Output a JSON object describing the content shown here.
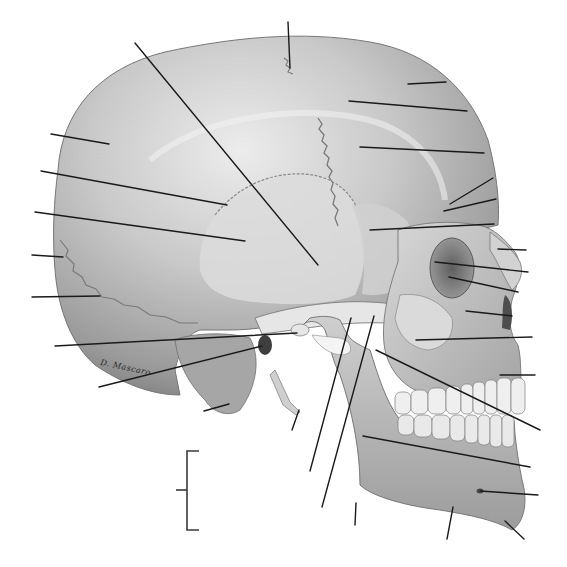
{
  "diagram": {
    "title": "",
    "view": "lateral-skull",
    "signature": "D. Mascaro",
    "colors": {
      "background": "#ffffff",
      "bone_light": "#e4e4e4",
      "bone_mid": "#bdbdbd",
      "bone_dark": "#8a8a8a",
      "bone_shadow": "#6a6a6a",
      "suture": "#7a7a7a",
      "leader_line": "#1a1a1a"
    },
    "leader_lines": [
      {
        "id": "L1",
        "x1": 288,
        "y1": 22,
        "x2": 290,
        "y2": 68
      },
      {
        "id": "L2",
        "x1": 135,
        "y1": 43,
        "x2": 318,
        "y2": 265
      },
      {
        "id": "L3",
        "x1": 408,
        "y1": 84,
        "x2": 446,
        "y2": 82
      },
      {
        "id": "L4",
        "x1": 349,
        "y1": 101,
        "x2": 467,
        "y2": 111
      },
      {
        "id": "L5",
        "x1": 360,
        "y1": 147,
        "x2": 484,
        "y2": 153
      },
      {
        "id": "L6",
        "x1": 51,
        "y1": 134,
        "x2": 109,
        "y2": 144
      },
      {
        "id": "L7",
        "x1": 41,
        "y1": 171,
        "x2": 227,
        "y2": 205
      },
      {
        "id": "L8",
        "x1": 35,
        "y1": 212,
        "x2": 245,
        "y2": 241
      },
      {
        "id": "L9",
        "x1": 450,
        "y1": 204,
        "x2": 493,
        "y2": 178
      },
      {
        "id": "L10",
        "x1": 444,
        "y1": 211,
        "x2": 496,
        "y2": 199
      },
      {
        "id": "L11",
        "x1": 370,
        "y1": 230,
        "x2": 494,
        "y2": 224
      },
      {
        "id": "L12",
        "x1": 32,
        "y1": 255,
        "x2": 63,
        "y2": 257
      },
      {
        "id": "L13",
        "x1": 498,
        "y1": 249,
        "x2": 526,
        "y2": 250
      },
      {
        "id": "L14",
        "x1": 435,
        "y1": 262,
        "x2": 528,
        "y2": 272
      },
      {
        "id": "L15",
        "x1": 449,
        "y1": 277,
        "x2": 518,
        "y2": 292
      },
      {
        "id": "L16",
        "x1": 32,
        "y1": 297,
        "x2": 100,
        "y2": 296
      },
      {
        "id": "L17",
        "x1": 466,
        "y1": 311,
        "x2": 512,
        "y2": 316
      },
      {
        "id": "L18",
        "x1": 416,
        "y1": 340,
        "x2": 532,
        "y2": 337
      },
      {
        "id": "L19",
        "x1": 55,
        "y1": 346,
        "x2": 297,
        "y2": 333
      },
      {
        "id": "L20",
        "x1": 99,
        "y1": 387,
        "x2": 262,
        "y2": 346
      },
      {
        "id": "L21",
        "x1": 500,
        "y1": 375,
        "x2": 535,
        "y2": 375
      },
      {
        "id": "L22",
        "x1": 376,
        "y1": 350,
        "x2": 540,
        "y2": 430
      },
      {
        "id": "L23",
        "x1": 204,
        "y1": 411,
        "x2": 229,
        "y2": 404
      },
      {
        "id": "L24",
        "x1": 292,
        "y1": 430,
        "x2": 299,
        "y2": 410
      },
      {
        "id": "L25",
        "x1": 351,
        "y1": 318,
        "x2": 310,
        "y2": 471
      },
      {
        "id": "L26",
        "x1": 374,
        "y1": 316,
        "x2": 322,
        "y2": 507
      },
      {
        "id": "L27",
        "x1": 363,
        "y1": 436,
        "x2": 530,
        "y2": 467
      },
      {
        "id": "L28",
        "x1": 480,
        "y1": 491,
        "x2": 538,
        "y2": 495
      },
      {
        "id": "L29",
        "x1": 356,
        "y1": 503,
        "x2": 355,
        "y2": 525
      },
      {
        "id": "L30",
        "x1": 453,
        "y1": 507,
        "x2": 447,
        "y2": 539
      },
      {
        "id": "L31",
        "x1": 505,
        "y1": 521,
        "x2": 524,
        "y2": 539
      }
    ],
    "bracket": {
      "x": 187,
      "top": 451,
      "bottom": 530,
      "tick_y": 490,
      "tick_x1": 176,
      "width": 12
    }
  }
}
